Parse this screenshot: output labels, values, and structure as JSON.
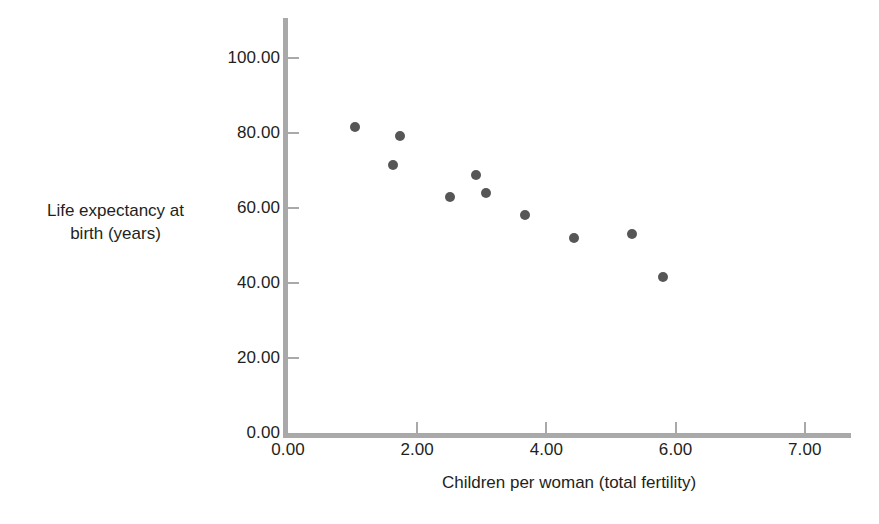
{
  "chart_data": {
    "type": "scatter",
    "title": "",
    "xlabel": "Children per woman (total fertility)",
    "ylabel": "Life expectancy at birth (years)",
    "ylabel_lines": [
      "Life expectancy at",
      "birth (years)"
    ],
    "xlim": [
      0,
      8.2
    ],
    "ylim": [
      0,
      107
    ],
    "grid": false,
    "legend": null,
    "marker_color": "#565656",
    "axis_color": "#a9a9a9",
    "text_color": "#231f20",
    "xticks": [
      {
        "label": "0.00",
        "value": 0
      },
      {
        "label": "2.00",
        "value": 2
      },
      {
        "label": "4.00",
        "value": 4
      },
      {
        "label": "6.00",
        "value": 6
      },
      {
        "label": "7.00",
        "value": 8
      }
    ],
    "yticks": [
      {
        "label": "0.00",
        "value": 0
      },
      {
        "label": "20.00",
        "value": 20
      },
      {
        "label": "40.00",
        "value": 40
      },
      {
        "label": "60.00",
        "value": 60
      },
      {
        "label": "80.00",
        "value": 80
      },
      {
        "label": "100.00",
        "value": 100
      }
    ],
    "points": [
      {
        "x": 1.04,
        "y": 81.6
      },
      {
        "x": 1.63,
        "y": 71.6
      },
      {
        "x": 1.74,
        "y": 79.2
      },
      {
        "x": 2.5,
        "y": 62.9
      },
      {
        "x": 2.91,
        "y": 68.7
      },
      {
        "x": 3.07,
        "y": 64.1
      },
      {
        "x": 3.67,
        "y": 58.1
      },
      {
        "x": 4.43,
        "y": 52.1
      },
      {
        "x": 5.33,
        "y": 53.1
      },
      {
        "x": 5.81,
        "y": 41.6
      }
    ]
  }
}
